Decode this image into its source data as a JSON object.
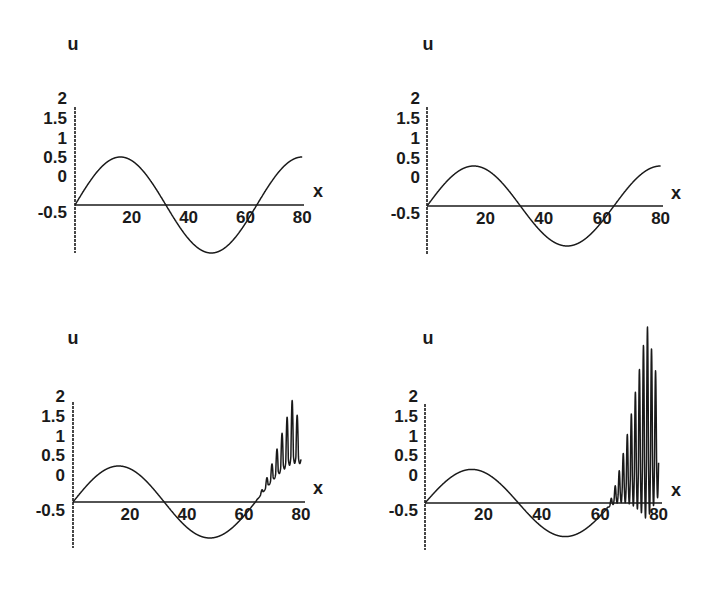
{
  "chart_data": [
    {
      "type": "line",
      "panel": "top-left",
      "xlabel": "x",
      "ylabel": "u",
      "x_ticks": [
        "20",
        "40",
        "60",
        "80"
      ],
      "y_ticks": [
        "2",
        "1.5",
        "1",
        "0.5",
        "0",
        "-0.5"
      ],
      "xlim": [
        0,
        80
      ],
      "ylim": [
        -0.5,
        2
      ],
      "grid": false,
      "series": [
        {
          "name": "u(x)",
          "form": "sine",
          "amplitude": 0.6,
          "period": 64,
          "packet": null
        }
      ],
      "layout": {
        "origin_x": 75,
        "origin_y": 205,
        "x_end": 304,
        "px_per_x": 2.84,
        "px_per_u": 80,
        "yaxis_top": 107,
        "yaxis_bottom": 253,
        "u_label": [
          73,
          50
        ],
        "x_label": [
          318,
          197
        ],
        "ytick_x": 67,
        "ytick_y": [
          104,
          124,
          144,
          163,
          182,
          218
        ],
        "xtick_y": 223
      }
    },
    {
      "type": "line",
      "panel": "top-right",
      "xlabel": "x",
      "ylabel": "u",
      "x_ticks": [
        "20",
        "40",
        "60",
        "80"
      ],
      "y_ticks": [
        "2",
        "1.5",
        "1",
        "0.5",
        "0",
        "-0.5"
      ],
      "xlim": [
        0,
        80
      ],
      "ylim": [
        -0.5,
        2
      ],
      "grid": false,
      "series": [
        {
          "name": "u(x)",
          "form": "sine",
          "amplitude": 0.5,
          "period": 64,
          "packet": null
        }
      ],
      "layout": {
        "origin_x": 427,
        "origin_y": 206,
        "x_end": 663,
        "px_per_x": 2.92,
        "px_per_u": 80,
        "yaxis_top": 107,
        "yaxis_bottom": 255,
        "u_label": [
          428,
          50
        ],
        "x_label": [
          676,
          199
        ],
        "ytick_x": 420,
        "ytick_y": [
          104,
          124,
          144,
          164,
          183,
          219
        ],
        "xtick_y": 224
      }
    },
    {
      "type": "line",
      "panel": "bottom-left",
      "xlabel": "x",
      "ylabel": "u",
      "x_ticks": [
        "20",
        "40",
        "60",
        "80"
      ],
      "y_ticks": [
        "2",
        "1.5",
        "1",
        "0.5",
        "0",
        "-0.5"
      ],
      "xlim": [
        0,
        80
      ],
      "ylim": [
        -0.5,
        2
      ],
      "grid": false,
      "series": [
        {
          "name": "u(x)",
          "form": "sine",
          "amplitude": 0.45,
          "period": 64,
          "packet": {
            "x_start": 64,
            "x_end": 80,
            "cycles": 9,
            "max_up": 0.7,
            "max_down": 0.1,
            "peak_x": 77
          }
        }
      ],
      "layout": {
        "origin_x": 73,
        "origin_y": 502,
        "x_end": 305,
        "px_per_x": 2.85,
        "px_per_u": 80,
        "yaxis_top": 402,
        "yaxis_bottom": 548,
        "u_label": [
          73,
          344
        ],
        "x_label": [
          318,
          494
        ],
        "ytick_x": 65,
        "ytick_y": [
          402,
          422,
          442,
          461,
          481,
          516
        ],
        "xtick_y": 520
      }
    },
    {
      "type": "line",
      "panel": "bottom-right",
      "xlabel": "x",
      "ylabel": "u",
      "x_ticks": [
        "20",
        "40",
        "60",
        "80"
      ],
      "y_ticks": [
        "2",
        "1.5",
        "1",
        "0.5",
        "0",
        "-0.5"
      ],
      "xlim": [
        0,
        80
      ],
      "ylim": [
        -0.5,
        2
      ],
      "grid": false,
      "series": [
        {
          "name": "u(x)",
          "form": "sine",
          "amplitude": 0.42,
          "period": 64,
          "packet": {
            "x_start": 62,
            "x_end": 80,
            "cycles": 13,
            "max_up": 1.7,
            "max_down": 0.75,
            "peak_x": 76
          }
        }
      ],
      "layout": {
        "origin_x": 425,
        "origin_y": 503,
        "x_end": 662,
        "px_per_x": 2.92,
        "px_per_u": 80,
        "yaxis_top": 404,
        "yaxis_bottom": 550,
        "u_label": [
          428,
          344
        ],
        "x_label": [
          676,
          496
        ],
        "ytick_x": 418,
        "ytick_y": [
          402,
          422,
          442,
          461,
          481,
          516
        ],
        "xtick_y": 520
      }
    }
  ]
}
